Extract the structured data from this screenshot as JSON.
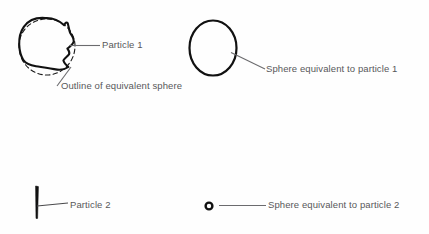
{
  "diagram": {
    "background_color": "#fefefe",
    "stroke_color": "#1a1a1a",
    "leader_line_color": "#6b6b6e",
    "text_color": "#58585a",
    "labels": {
      "particle_1": "Particle 1",
      "outline_of_equivalent_sphere": "Outline of equivalent sphere",
      "sphere_equivalent_to_particle_1": "Sphere equivalent to particle 1",
      "particle_2": "Particle 2",
      "sphere_equivalent_to_particle_2": "Sphere equivalent to particle 2"
    },
    "shapes": {
      "particle_1": {
        "icon": "irregular-blob-shape",
        "description": "irregular angular particle outline",
        "center": [
          48,
          47
        ]
      },
      "equivalent_sphere_outline_1": {
        "icon": "dashed-circle-outline",
        "description": "dashed circle overlaid on particle 1",
        "center": [
          47,
          47
        ],
        "radius": 28
      },
      "sphere_1": {
        "icon": "circle-outline",
        "description": "solid ellipse representing sphere equivalent to particle 1",
        "center": [
          213,
          48
        ],
        "rx": 24,
        "ry": 28
      },
      "particle_2": {
        "icon": "needle-sliver-shape",
        "description": "thin vertical needle shaped particle",
        "center": [
          37,
          202
        ]
      },
      "sphere_2": {
        "icon": "small-circle-outline",
        "description": "small ring representing sphere equivalent to particle 2",
        "center": [
          209,
          206
        ],
        "radius": 4
      }
    }
  }
}
